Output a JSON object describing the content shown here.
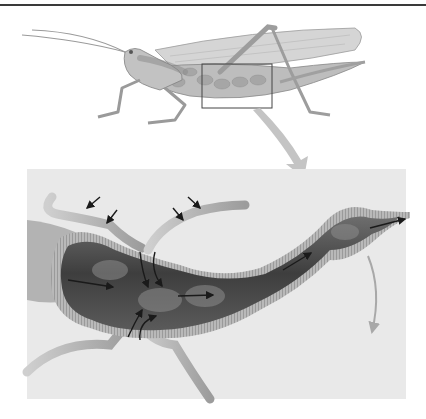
{
  "figure": {
    "title": "",
    "labels": [],
    "colors": {
      "background": "#ffffff",
      "panel": "#e9e9e9",
      "top_rule": "#3a3a3a",
      "insect": "#b8b8b8",
      "gut_interior": "#4a4a4a",
      "gut_wall": "#a9a9a9",
      "tubule": "#c4c4c4",
      "arrows_dark": "#1a1a1a",
      "arrow_light": "#b0b0b0",
      "magnify_box": "#444444"
    },
    "flow_arrows": {
      "tubule_inflow_count": 4,
      "tubule_to_gut_count": 4,
      "gut_flow_count": 4,
      "exit_arrow": 1
    }
  }
}
